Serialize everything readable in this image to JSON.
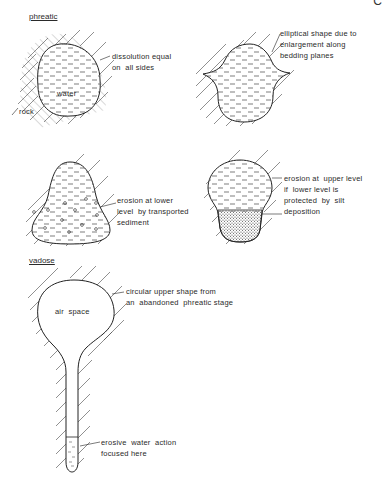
{
  "corner_mark": "C",
  "sections": {
    "phreatic": {
      "title": "phreatic"
    },
    "vadose": {
      "title": "vadose"
    }
  },
  "diagrams": [
    {
      "id": "phreatic-round",
      "labels": {
        "water": "water",
        "rock": "rock"
      },
      "annotation": [
        "dissolution equal",
        "on  all sides"
      ]
    },
    {
      "id": "phreatic-elliptical",
      "annotation": [
        "elliptical shape due to",
        "enlargement along",
        "bedding planes"
      ]
    },
    {
      "id": "phreatic-lower-erosion",
      "annotation": [
        "erosion at lower",
        "level  by transported",
        "sediment"
      ]
    },
    {
      "id": "phreatic-upper-erosion",
      "annotation": [
        "erosion at  upper level",
        "if  lower level is",
        "protected  by  silt",
        "deposition"
      ]
    },
    {
      "id": "vadose-keyhole",
      "labels": {
        "air_space": "air  space"
      },
      "annotation_top": [
        "circular upper shape from",
        "an  abandoned  phreatic stage"
      ],
      "annotation_bottom": [
        "erosive  water  action",
        "focused here"
      ]
    }
  ]
}
